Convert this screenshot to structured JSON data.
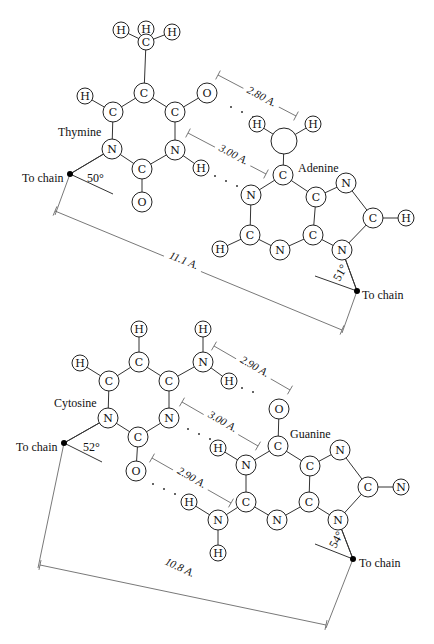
{
  "pairs": [
    {
      "name": "AT",
      "labels": [
        {
          "id": "thymine",
          "text": "Thymine",
          "x": 58,
          "y": 132
        },
        {
          "id": "adenine",
          "text": "Adenine",
          "x": 298,
          "y": 168
        },
        {
          "id": "to-chain-left",
          "text": "To chain",
          "x": 22,
          "y": 178
        },
        {
          "id": "to-chain-right",
          "text": "To chain",
          "x": 362,
          "y": 295
        }
      ],
      "atoms": [
        {
          "e": "H",
          "x": 121,
          "y": 30,
          "r": 8
        },
        {
          "e": "H",
          "x": 146,
          "y": 29,
          "r": 8
        },
        {
          "e": "H",
          "x": 172,
          "y": 32,
          "r": 8
        },
        {
          "e": "C",
          "x": 146,
          "y": 42,
          "r": 8
        },
        {
          "e": "C",
          "x": 144,
          "y": 93,
          "r": 10
        },
        {
          "e": "H",
          "x": 85,
          "y": 96,
          "r": 8
        },
        {
          "e": "O",
          "x": 207,
          "y": 93,
          "r": 10
        },
        {
          "e": "C",
          "x": 113,
          "y": 112,
          "r": 10
        },
        {
          "e": "C",
          "x": 175,
          "y": 112,
          "r": 10
        },
        {
          "e": "N",
          "x": 112,
          "y": 149,
          "r": 10
        },
        {
          "e": "N",
          "x": 175,
          "y": 150,
          "r": 10
        },
        {
          "e": "C",
          "x": 142,
          "y": 169,
          "r": 10
        },
        {
          "e": "H",
          "x": 201,
          "y": 168,
          "r": 8
        },
        {
          "e": "O",
          "x": 142,
          "y": 202,
          "r": 10
        },
        {
          "e": "H",
          "x": 257,
          "y": 124,
          "r": 8
        },
        {
          "e": "",
          "x": 284,
          "y": 141,
          "r": 13
        },
        {
          "e": "H",
          "x": 313,
          "y": 124,
          "r": 8
        },
        {
          "e": "C",
          "x": 283,
          "y": 175,
          "r": 10
        },
        {
          "e": "N",
          "x": 251,
          "y": 195,
          "r": 10
        },
        {
          "e": "C",
          "x": 316,
          "y": 197,
          "r": 10
        },
        {
          "e": "N",
          "x": 346,
          "y": 183,
          "r": 10
        },
        {
          "e": "C",
          "x": 373,
          "y": 218,
          "r": 10
        },
        {
          "e": "H",
          "x": 406,
          "y": 218,
          "r": 8
        },
        {
          "e": "C",
          "x": 250,
          "y": 235,
          "r": 10
        },
        {
          "e": "C",
          "x": 313,
          "y": 235,
          "r": 10
        },
        {
          "e": "H",
          "x": 220,
          "y": 249,
          "r": 8
        },
        {
          "e": "N",
          "x": 280,
          "y": 250,
          "r": 10
        },
        {
          "e": "N",
          "x": 342,
          "y": 250,
          "r": 10
        }
      ],
      "bonds": [
        [
          121,
          30,
          146,
          42
        ],
        [
          172,
          32,
          146,
          42
        ],
        [
          146,
          42,
          144,
          93
        ],
        [
          144,
          93,
          113,
          112
        ],
        [
          144,
          93,
          175,
          112
        ],
        [
          85,
          96,
          113,
          112
        ],
        [
          175,
          112,
          207,
          93
        ],
        [
          113,
          112,
          112,
          149
        ],
        [
          175,
          112,
          175,
          150
        ],
        [
          112,
          149,
          142,
          169
        ],
        [
          175,
          150,
          142,
          169
        ],
        [
          175,
          150,
          201,
          168
        ],
        [
          142,
          169,
          142,
          202
        ],
        [
          112,
          149,
          70,
          174
        ],
        [
          257,
          124,
          284,
          141
        ],
        [
          313,
          124,
          284,
          141
        ],
        [
          284,
          141,
          283,
          175
        ],
        [
          283,
          175,
          251,
          195
        ],
        [
          283,
          175,
          316,
          197
        ],
        [
          316,
          197,
          346,
          183
        ],
        [
          346,
          183,
          373,
          218
        ],
        [
          373,
          218,
          406,
          218
        ],
        [
          251,
          195,
          250,
          235
        ],
        [
          316,
          197,
          313,
          235
        ],
        [
          250,
          235,
          220,
          249
        ],
        [
          250,
          235,
          280,
          250
        ],
        [
          313,
          235,
          280,
          250
        ],
        [
          313,
          235,
          342,
          250
        ],
        [
          342,
          250,
          373,
          218
        ],
        [
          342,
          250,
          357,
          291
        ]
      ],
      "hbond_dots": [
        [
          231,
          107
        ],
        [
          242,
          112
        ],
        [
          253,
          117
        ],
        [
          215,
          176
        ],
        [
          226,
          181
        ],
        [
          237,
          186
        ]
      ],
      "chain_dots": [
        [
          70,
          174
        ],
        [
          357,
          291
        ]
      ],
      "angles": [
        {
          "text": "50°",
          "x": 87,
          "y": 178,
          "rot": 0,
          "lines": [
            [
              70,
              174,
              112,
              149
            ],
            [
              70,
              174,
              113,
              194
            ]
          ]
        },
        {
          "text": "51°",
          "x": 336,
          "y": 280,
          "rot": -60,
          "lines": [
            [
              357,
              291,
              342,
              250
            ],
            [
              357,
              291,
              315,
              276
            ]
          ]
        }
      ],
      "dims": [
        {
          "text": "2.80 A.",
          "line": [
            218,
            75,
            296,
            116
          ],
          "tx": 262,
          "ty": 96,
          "rot": 28
        },
        {
          "text": "3.00 A.",
          "line": [
            188,
            133,
            266,
            174
          ],
          "tx": 234,
          "ty": 154,
          "rot": 28
        },
        {
          "text": "11.1 A.",
          "line": [
            55,
            211,
            342,
            330
          ],
          "tx": 184,
          "ty": 260,
          "rot": 22
        }
      ],
      "ext_lines": [
        [
          70,
          174,
          55,
          215
        ],
        [
          357,
          291,
          342,
          333
        ]
      ]
    },
    {
      "name": "CG",
      "labels": [
        {
          "id": "cytosine",
          "text": "Cytosine",
          "x": 54,
          "y": 403
        },
        {
          "id": "guanine",
          "text": "Guanine",
          "x": 290,
          "y": 434
        },
        {
          "id": "to-chain-left",
          "text": "To chain",
          "x": 16,
          "y": 447
        },
        {
          "id": "to-chain-right",
          "text": "To chain",
          "x": 359,
          "y": 563
        }
      ],
      "atoms": [
        {
          "e": "H",
          "x": 139,
          "y": 329,
          "r": 8
        },
        {
          "e": "H",
          "x": 203,
          "y": 329,
          "r": 8
        },
        {
          "e": "C",
          "x": 139,
          "y": 362,
          "r": 10
        },
        {
          "e": "H",
          "x": 80,
          "y": 363,
          "r": 8
        },
        {
          "e": "N",
          "x": 203,
          "y": 362,
          "r": 10
        },
        {
          "e": "C",
          "x": 109,
          "y": 381,
          "r": 10
        },
        {
          "e": "C",
          "x": 169,
          "y": 381,
          "r": 10
        },
        {
          "e": "H",
          "x": 229,
          "y": 381,
          "r": 8
        },
        {
          "e": "N",
          "x": 108,
          "y": 418,
          "r": 10
        },
        {
          "e": "N",
          "x": 169,
          "y": 418,
          "r": 10
        },
        {
          "e": "C",
          "x": 138,
          "y": 437,
          "r": 10
        },
        {
          "e": "O",
          "x": 136,
          "y": 471,
          "r": 10
        },
        {
          "e": "O",
          "x": 279,
          "y": 409,
          "r": 10
        },
        {
          "e": "C",
          "x": 278,
          "y": 446,
          "r": 10
        },
        {
          "e": "H",
          "x": 218,
          "y": 448,
          "r": 8
        },
        {
          "e": "N",
          "x": 246,
          "y": 465,
          "r": 10
        },
        {
          "e": "C",
          "x": 310,
          "y": 466,
          "r": 10
        },
        {
          "e": "N",
          "x": 340,
          "y": 450,
          "r": 10
        },
        {
          "e": "C",
          "x": 368,
          "y": 487,
          "r": 10
        },
        {
          "e": "N",
          "x": 401,
          "y": 487,
          "r": 8
        },
        {
          "e": "H",
          "x": 189,
          "y": 502,
          "r": 8
        },
        {
          "e": "C",
          "x": 246,
          "y": 502,
          "r": 10
        },
        {
          "e": "C",
          "x": 309,
          "y": 502,
          "r": 10
        },
        {
          "e": "N",
          "x": 218,
          "y": 520,
          "r": 10
        },
        {
          "e": "N",
          "x": 277,
          "y": 520,
          "r": 10
        },
        {
          "e": "N",
          "x": 338,
          "y": 520,
          "r": 10
        },
        {
          "e": "H",
          "x": 218,
          "y": 553,
          "r": 8
        }
      ],
      "bonds": [
        [
          139,
          329,
          139,
          362
        ],
        [
          203,
          329,
          203,
          362
        ],
        [
          139,
          362,
          109,
          381
        ],
        [
          139,
          362,
          169,
          381
        ],
        [
          80,
          363,
          109,
          381
        ],
        [
          169,
          381,
          203,
          362
        ],
        [
          203,
          362,
          229,
          381
        ],
        [
          109,
          381,
          108,
          418
        ],
        [
          169,
          381,
          169,
          418
        ],
        [
          108,
          418,
          138,
          437
        ],
        [
          169,
          418,
          138,
          437
        ],
        [
          138,
          437,
          136,
          471
        ],
        [
          108,
          418,
          64,
          443
        ],
        [
          279,
          409,
          278,
          446
        ],
        [
          278,
          446,
          246,
          465
        ],
        [
          278,
          446,
          310,
          466
        ],
        [
          218,
          448,
          246,
          465
        ],
        [
          310,
          466,
          340,
          450
        ],
        [
          340,
          450,
          368,
          487
        ],
        [
          368,
          487,
          401,
          487
        ],
        [
          246,
          465,
          246,
          502
        ],
        [
          310,
          466,
          309,
          502
        ],
        [
          246,
          502,
          218,
          520
        ],
        [
          246,
          502,
          277,
          520
        ],
        [
          309,
          502,
          277,
          520
        ],
        [
          309,
          502,
          338,
          520
        ],
        [
          338,
          520,
          368,
          487
        ],
        [
          189,
          502,
          218,
          520
        ],
        [
          218,
          520,
          218,
          553
        ],
        [
          338,
          520,
          353,
          559
        ]
      ],
      "hbond_dots": [
        [
          253,
          392
        ],
        [
          242,
          388
        ],
        [
          231,
          383
        ],
        [
          188,
          429
        ],
        [
          199,
          434
        ],
        [
          210,
          439
        ],
        [
          153,
          484
        ],
        [
          164,
          489
        ],
        [
          175,
          494
        ]
      ],
      "chain_dots": [
        [
          64,
          443
        ],
        [
          353,
          559
        ]
      ],
      "angles": [
        {
          "text": "52°",
          "x": 83,
          "y": 447,
          "rot": 0,
          "lines": [
            [
              64,
              443,
              108,
              418
            ],
            [
              64,
              443,
              102,
              462
            ]
          ]
        },
        {
          "text": "54°",
          "x": 332,
          "y": 547,
          "rot": -60,
          "lines": [
            [
              353,
              559,
              338,
              520
            ],
            [
              353,
              559,
              315,
              544
            ]
          ]
        }
      ],
      "dims": [
        {
          "text": "2.90 A.",
          "line": [
            214,
            346,
            290,
            390
          ],
          "tx": 255,
          "ty": 366,
          "rot": 30
        },
        {
          "text": "3.00 A.",
          "line": [
            182,
            402,
            258,
            446
          ],
          "tx": 223,
          "ty": 421,
          "rot": 30
        },
        {
          "text": "2.90 A.",
          "line": [
            152,
            458,
            231,
            503
          ],
          "tx": 192,
          "ty": 477,
          "rot": 30
        },
        {
          "text": "10.8 A.",
          "line": [
            40,
            565,
            326,
            625
          ],
          "tx": 180,
          "ty": 567,
          "rot": 25
        }
      ],
      "ext_lines": [
        [
          64,
          443,
          38,
          568
        ],
        [
          353,
          559,
          326,
          628
        ]
      ]
    }
  ]
}
